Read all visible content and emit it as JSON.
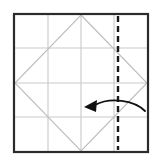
{
  "figure": {
    "title": "Origami folding step diagram",
    "canvas": {
      "width": 161,
      "height": 165,
      "background": "#ffffff"
    }
  },
  "colors": {
    "paper_border": "#2b2b2b",
    "grid_line": "#c9c9c9",
    "diamond_line": "#bdbdbd",
    "fold_line": "#1a1a1a",
    "arrow": "#111111",
    "background": "#ffffff"
  },
  "paper": {
    "name": "square-sheet",
    "x": 14,
    "y": 14,
    "width": 134,
    "height": 138,
    "stroke_width": 2.2
  },
  "grid": {
    "vertical_lines": [
      {
        "name": "grid-line-vertical-quarter",
        "x": 48,
        "y1": 14,
        "y2": 152
      },
      {
        "name": "grid-line-vertical-center",
        "x": 81,
        "y1": 14,
        "y2": 152
      },
      {
        "name": "grid-line-vertical-three-quarter",
        "x": 114,
        "y1": 14,
        "y2": 152
      }
    ],
    "horizontal_lines": [
      {
        "name": "grid-line-horizontal-quarter",
        "y": 48,
        "x1": 14,
        "x2": 148
      },
      {
        "name": "grid-line-horizontal-center",
        "y": 83,
        "x1": 14,
        "x2": 148
      },
      {
        "name": "grid-line-horizontal-three-quarter",
        "y": 117,
        "x1": 14,
        "x2": 148
      }
    ],
    "stroke_width": 1.1
  },
  "diamond": {
    "name": "inscribed-diamond",
    "points": "81,15 147,83 81,151 15,83",
    "stroke_width": 1.1,
    "vertices": [
      {
        "name": "diamond-vertex-top",
        "x": 81,
        "y": 15
      },
      {
        "name": "diamond-vertex-right",
        "x": 147,
        "y": 83
      },
      {
        "name": "diamond-vertex-bottom",
        "x": 81,
        "y": 151
      },
      {
        "name": "diamond-vertex-left",
        "x": 15,
        "y": 83
      }
    ]
  },
  "fold_line": {
    "name": "vertical-dashed-fold-line",
    "x": 118,
    "y1": 16,
    "y2": 150,
    "stroke_width": 2.4,
    "dash_pattern": "6 4"
  },
  "arrow": {
    "name": "fold-direction-arrow",
    "direction": "right-to-left",
    "path": "M145,111 C134,100 110,97 95,105",
    "stroke_width": 1.8,
    "head_points": "84,107 97,100 96,112",
    "tip": {
      "x": 84,
      "y": 107
    },
    "tail": {
      "x": 145,
      "y": 111
    }
  }
}
